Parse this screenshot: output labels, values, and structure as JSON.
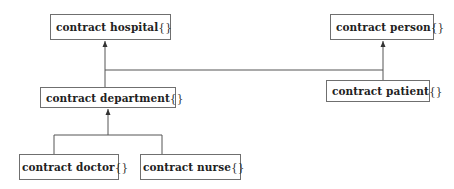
{
  "diagram": {
    "type": "inheritance-tree",
    "line_color": "#555555",
    "box_border_color": "#6f6f6f",
    "nodes": {
      "hospital": {
        "keyword": "contract",
        "name": "hospital",
        "braces": "{}"
      },
      "person": {
        "keyword": "contract",
        "name": "person",
        "braces": "{}"
      },
      "department": {
        "keyword": "contract",
        "name": "department",
        "braces": "{}"
      },
      "patient": {
        "keyword": "contract",
        "name": "patient",
        "braces": "{}"
      },
      "doctor": {
        "keyword": "contract",
        "name": "doctor",
        "braces": "{}"
      },
      "nurse": {
        "keyword": "contract",
        "name": "nurse",
        "braces": "{}"
      }
    },
    "edges": [
      {
        "from": "department",
        "to": "hospital",
        "arrow": "triangle"
      },
      {
        "from": "department",
        "to": "person",
        "arrow": "triangle"
      },
      {
        "from": "patient",
        "to": "person",
        "arrow": "triangle"
      },
      {
        "from": "doctor",
        "to": "department",
        "arrow": "triangle"
      },
      {
        "from": "nurse",
        "to": "department",
        "arrow": "triangle"
      }
    ]
  }
}
